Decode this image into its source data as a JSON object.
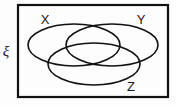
{
  "figure": {
    "background_color": "#fdfdfd",
    "stroke_color": "#111111"
  },
  "universal_set": {
    "symbol": "ξ",
    "name": "universal-set-xi",
    "border_color": "#111111"
  },
  "sets": [
    {
      "id": "X",
      "label": "X",
      "position": "top-left",
      "cx": 74,
      "cy": 45,
      "rx": 46,
      "ry": 21,
      "label_x": 45,
      "label_y": 24
    },
    {
      "id": "Y",
      "label": "Y",
      "position": "top-right",
      "cx": 112,
      "cy": 45,
      "rx": 46,
      "ry": 21,
      "label_x": 141,
      "label_y": 24
    },
    {
      "id": "Z",
      "label": "Z",
      "position": "bottom-center",
      "cx": 94,
      "cy": 64,
      "rx": 46,
      "ry": 21,
      "label_x": 131,
      "label_y": 91
    }
  ],
  "chart_data": {
    "type": "diagram",
    "diagram_type": "venn",
    "set_count": 3,
    "set_labels": [
      "X",
      "Y",
      "Z"
    ],
    "universal_set_label": "ξ",
    "regions": [
      "X only",
      "Y only",
      "Z only",
      "X ∩ Y",
      "X ∩ Z",
      "Y ∩ Z",
      "X ∩ Y ∩ Z",
      "ξ outside X ∪ Y ∪ Z"
    ],
    "legend": "none",
    "grid": false
  }
}
